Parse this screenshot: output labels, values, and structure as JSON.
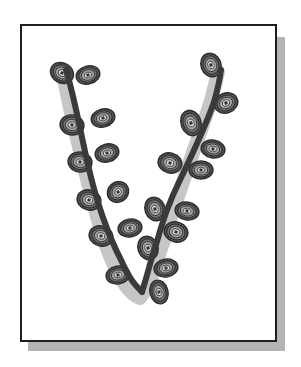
{
  "illustration": {
    "subject": "letter V formed by a budding branch",
    "letter": "V",
    "frame": {
      "x": 20,
      "y": 24,
      "width": 257,
      "height": 318,
      "border_color": "#1e1e1e",
      "fill": "#ffffff"
    },
    "frame_shadow": {
      "offset_x": 8,
      "offset_y": 9,
      "color": "#b4b4b4"
    },
    "branch": {
      "color": "#3a3a3a",
      "underlay_color": "#c6c6c6",
      "left_arm_path": "M66,70 C74,95 80,130 88,165 C96,200 108,235 122,262 C130,280 136,286 142,292",
      "right_arm_path": "M142,292 C146,280 150,262 156,245 C162,222 170,200 180,180 C192,155 206,125 214,102 C218,88 220,78 221,70",
      "underlay_path": "M62,70 C70,110 84,170 98,220 C110,262 124,292 140,298 C150,286 156,262 164,240 C176,200 194,150 208,110 C214,92 216,80 218,72"
    },
    "buds": {
      "fill": "#8a8a8a",
      "ring_color": "#2e2e2e",
      "center_color": "#d8d8d8",
      "items": [
        {
          "cx": 62,
          "cy": 73,
          "rx": 12,
          "ry": 10,
          "rot": 30
        },
        {
          "cx": 88,
          "cy": 75,
          "rx": 12,
          "ry": 9,
          "rot": -15
        },
        {
          "cx": 72,
          "cy": 125,
          "rx": 12,
          "ry": 10,
          "rot": 10
        },
        {
          "cx": 103,
          "cy": 118,
          "rx": 12,
          "ry": 9,
          "rot": -15
        },
        {
          "cx": 80,
          "cy": 162,
          "rx": 12,
          "ry": 10,
          "rot": 10
        },
        {
          "cx": 107,
          "cy": 153,
          "rx": 12,
          "ry": 9,
          "rot": -15
        },
        {
          "cx": 89,
          "cy": 200,
          "rx": 12,
          "ry": 10,
          "rot": 15
        },
        {
          "cx": 118,
          "cy": 192,
          "rx": 11,
          "ry": 10,
          "rot": -40
        },
        {
          "cx": 101,
          "cy": 236,
          "rx": 12,
          "ry": 10,
          "rot": 15
        },
        {
          "cx": 130,
          "cy": 228,
          "rx": 12,
          "ry": 9,
          "rot": -10
        },
        {
          "cx": 118,
          "cy": 275,
          "rx": 12,
          "ry": 9,
          "rot": -10
        },
        {
          "cx": 211,
          "cy": 65,
          "rx": 10,
          "ry": 12,
          "rot": -20
        },
        {
          "cx": 226,
          "cy": 103,
          "rx": 12,
          "ry": 10,
          "rot": -20
        },
        {
          "cx": 191,
          "cy": 123,
          "rx": 10,
          "ry": 13,
          "rot": -20
        },
        {
          "cx": 213,
          "cy": 149,
          "rx": 12,
          "ry": 9,
          "rot": 10
        },
        {
          "cx": 170,
          "cy": 163,
          "rx": 12,
          "ry": 10,
          "rot": 15
        },
        {
          "cx": 201,
          "cy": 170,
          "rx": 12,
          "ry": 9,
          "rot": 0
        },
        {
          "cx": 155,
          "cy": 209,
          "rx": 10,
          "ry": 12,
          "rot": -20
        },
        {
          "cx": 187,
          "cy": 211,
          "rx": 12,
          "ry": 9,
          "rot": 10
        },
        {
          "cx": 176,
          "cy": 232,
          "rx": 12,
          "ry": 10,
          "rot": 15
        },
        {
          "cx": 148,
          "cy": 248,
          "rx": 10,
          "ry": 12,
          "rot": -20
        },
        {
          "cx": 166,
          "cy": 268,
          "rx": 12,
          "ry": 9,
          "rot": -10
        },
        {
          "cx": 159,
          "cy": 292,
          "rx": 9,
          "ry": 12,
          "rot": -15
        }
      ]
    }
  }
}
